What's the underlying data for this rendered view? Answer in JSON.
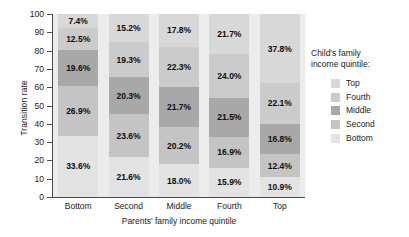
{
  "chart_data": {
    "type": "bar",
    "subtype": "stacked-bar-100",
    "title": "",
    "xlabel": "Parents' family income quintile",
    "ylabel": "Transition rate",
    "ylim": [
      0,
      100
    ],
    "ytick_labels": [
      "100",
      "90",
      "80",
      "70",
      "60",
      "50",
      "40",
      "30",
      "20",
      "10",
      "0"
    ],
    "ytick_values": [
      100,
      90,
      80,
      70,
      60,
      50,
      40,
      30,
      20,
      10,
      0
    ],
    "grid": false,
    "legend_position": "right",
    "legend_title": "Child's family income quintile:",
    "categories": [
      "Bottom",
      "Second",
      "Middle",
      "Fourth",
      "Top"
    ],
    "series": [
      {
        "name": "Bottom",
        "color": "#e3e3e3",
        "values": [
          33.6,
          21.6,
          18.0,
          15.9,
          10.9
        ]
      },
      {
        "name": "Second",
        "color": "#c4c4c4",
        "values": [
          26.9,
          23.6,
          20.2,
          16.9,
          12.4
        ]
      },
      {
        "name": "Middle",
        "color": "#a8a8a8",
        "values": [
          19.6,
          20.3,
          21.7,
          21.5,
          16.8
        ]
      },
      {
        "name": "Fourth",
        "color": "#cbcbcb",
        "values": [
          12.5,
          19.3,
          22.3,
          24.0,
          22.1
        ]
      },
      {
        "name": "Top",
        "color": "#d8d8d8",
        "values": [
          7.4,
          15.2,
          17.8,
          21.7,
          37.8
        ]
      }
    ],
    "data_labels": {
      "Bottom": [
        "7.4%",
        "12.5%",
        "19.6%",
        "26.9%",
        "33.6%"
      ],
      "Second": [
        "15.2%",
        "19.3%",
        "20.3%",
        "23.6%",
        "21.6%"
      ],
      "Middle": [
        "17.8%",
        "22.3%",
        "21.7%",
        "20.2%",
        "18.0%"
      ],
      "Fourth": [
        "21.7%",
        "24.0%",
        "21.5%",
        "16.9%",
        "15.9%"
      ],
      "Top": [
        "37.8%",
        "22.1%",
        "16.8%",
        "12.4%",
        "10.9%"
      ]
    }
  },
  "legend": {
    "title_line1": "Child's family",
    "title_line2": "income quintile:",
    "entries": [
      {
        "label": "Top",
        "color": "#d8d8d8"
      },
      {
        "label": "Fourth",
        "color": "#cbcbcb"
      },
      {
        "label": "Middle",
        "color": "#a8a8a8"
      },
      {
        "label": "Second",
        "color": "#c4c4c4"
      },
      {
        "label": "Bottom",
        "color": "#e3e3e3"
      }
    ]
  },
  "axes": {
    "y_title": "Transition rate",
    "x_title": "Parents' family income quintile"
  }
}
